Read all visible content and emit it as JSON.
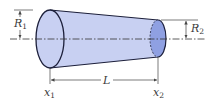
{
  "diagram": {
    "labels": {
      "r1": "R",
      "r1_sub": "1",
      "r2": "R",
      "r2_sub": "2",
      "length": "L",
      "x1": "x",
      "x1_sub": "1",
      "x2": "x",
      "x2_sub": "2"
    },
    "colors": {
      "body_fill": "#c8d0f2",
      "end_face_fill": "#8fa0e2",
      "outline": "#1c1f3a",
      "dim_line": "#444444"
    }
  }
}
